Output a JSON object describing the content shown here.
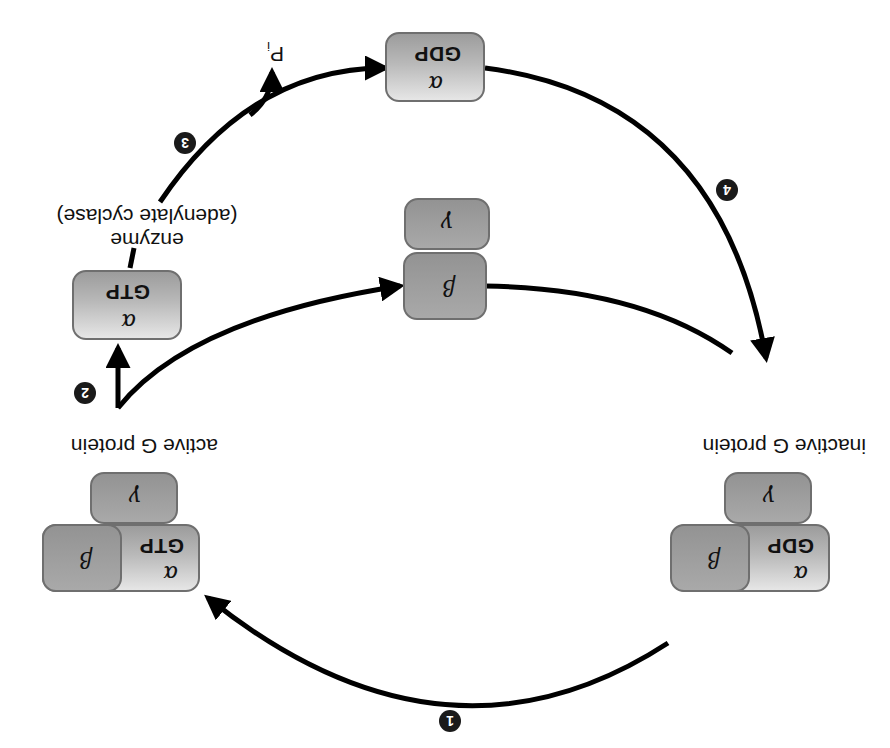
{
  "diagram": {
    "orientation": "rotated 180 degrees",
    "states": {
      "inactive": {
        "label": "inactive G protein",
        "alpha": "α",
        "nucleotide": "GDP",
        "beta": "β",
        "gamma": "γ"
      },
      "active": {
        "label": "active G protein",
        "alpha": "α",
        "nucleotide": "GTP",
        "beta": "β",
        "gamma": "γ"
      },
      "alpha_gtp": {
        "alpha": "α",
        "nucleotide": "GTP"
      },
      "beta_gamma": {
        "beta": "β",
        "gamma": "γ"
      },
      "alpha_gdp": {
        "alpha": "α",
        "nucleotide": "GDP"
      }
    },
    "enzyme_label": {
      "line1": "enzyme",
      "line2": "(adenylate cyclase)"
    },
    "phosphate_label": "P",
    "phosphate_subscript": "i",
    "steps": [
      "1",
      "2",
      "3",
      "4"
    ],
    "colors": {
      "arrow": "#000000",
      "badge": "#1a1a1a",
      "box_border": "#6f6f6f"
    }
  }
}
